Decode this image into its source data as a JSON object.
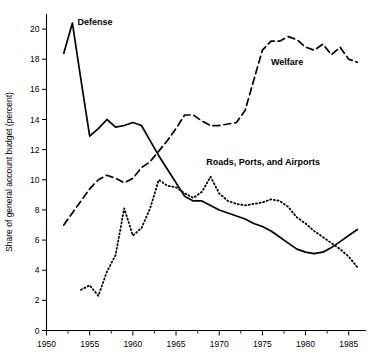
{
  "chart_data": {
    "type": "line",
    "title": "",
    "subtitle": "",
    "xlabel": "",
    "ylabel": "Share of general account budget (percent)",
    "xlim": [
      1950,
      1987
    ],
    "ylim": [
      0,
      21
    ],
    "grid": false,
    "legend_position": "inline-annotations",
    "x_ticks": [
      1950,
      1955,
      1960,
      1965,
      1970,
      1975,
      1980,
      1985
    ],
    "x_tick_labels": [
      "1950",
      "1955",
      "1960",
      "1965",
      "1970",
      "1975",
      "1980",
      "1985"
    ],
    "x_minor_ticks": [
      1952.5,
      1957.5,
      1962.5,
      1967.5,
      1972.5,
      1977.5,
      1982.5
    ],
    "y_ticks": [
      0,
      2,
      4,
      6,
      8,
      10,
      12,
      14,
      16,
      18,
      20
    ],
    "y_tick_labels": [
      "0",
      "2",
      "4",
      "6",
      "8",
      "10",
      "12",
      "14",
      "16",
      "18",
      "20"
    ],
    "series": [
      {
        "name": "Defense",
        "label": "Defense",
        "style": "solid",
        "x": [
          1952,
          1953,
          1954,
          1955,
          1956,
          1957,
          1958,
          1959,
          1960,
          1961,
          1962,
          1963,
          1964,
          1965,
          1966,
          1967,
          1968,
          1969,
          1970,
          1971,
          1972,
          1973,
          1974,
          1975,
          1976,
          1977,
          1978,
          1979,
          1980,
          1981,
          1982,
          1983,
          1984,
          1985,
          1986
        ],
        "values": [
          18.4,
          20.4,
          16.6,
          12.9,
          13.4,
          14.0,
          13.5,
          13.6,
          13.8,
          13.6,
          12.6,
          11.6,
          10.7,
          9.8,
          8.9,
          8.6,
          8.6,
          8.3,
          8.0,
          7.8,
          7.6,
          7.4,
          7.1,
          6.9,
          6.6,
          6.2,
          5.8,
          5.4,
          5.2,
          5.1,
          5.2,
          5.5,
          5.9,
          6.3,
          6.7
        ]
      },
      {
        "name": "Welfare",
        "label": "Welfare",
        "style": "dashed",
        "x": [
          1952,
          1953,
          1954,
          1955,
          1956,
          1957,
          1958,
          1959,
          1960,
          1961,
          1962,
          1963,
          1964,
          1965,
          1966,
          1967,
          1968,
          1969,
          1970,
          1971,
          1972,
          1973,
          1974,
          1975,
          1976,
          1977,
          1978,
          1979,
          1980,
          1981,
          1982,
          1983,
          1984,
          1985,
          1986
        ],
        "values": [
          7.0,
          7.8,
          8.6,
          9.4,
          10.0,
          10.3,
          10.1,
          9.8,
          10.1,
          10.8,
          11.2,
          11.9,
          12.6,
          13.4,
          14.3,
          14.3,
          13.9,
          13.6,
          13.6,
          13.7,
          13.8,
          14.6,
          16.6,
          18.6,
          19.2,
          19.2,
          19.5,
          19.3,
          18.8,
          18.6,
          19.0,
          18.3,
          18.8,
          18.0,
          17.8
        ]
      },
      {
        "name": "Roads, Ports, and Airports",
        "label": "Roads, Ports, and Airports",
        "style": "dotted",
        "x": [
          1954,
          1955,
          1956,
          1957,
          1958,
          1959,
          1960,
          1961,
          1962,
          1963,
          1964,
          1965,
          1966,
          1967,
          1968,
          1969,
          1970,
          1971,
          1972,
          1973,
          1974,
          1975,
          1976,
          1977,
          1978,
          1979,
          1980,
          1981,
          1982,
          1983,
          1984,
          1985,
          1986
        ],
        "values": [
          2.7,
          3.0,
          2.3,
          3.9,
          5.0,
          8.1,
          6.3,
          6.8,
          8.1,
          10.0,
          9.6,
          9.5,
          9.1,
          8.8,
          9.2,
          10.2,
          9.1,
          8.6,
          8.4,
          8.3,
          8.4,
          8.5,
          8.7,
          8.6,
          8.2,
          7.5,
          7.1,
          6.6,
          6.2,
          5.8,
          5.4,
          4.9,
          4.2
        ]
      }
    ],
    "annotations": [
      {
        "name": "defense-label",
        "text": "Defense",
        "x": 1953.6,
        "y": 20.3
      },
      {
        "name": "welfare-label",
        "text": "Welfare",
        "x": 1976.0,
        "y": 17.6
      },
      {
        "name": "roads-label",
        "text": "Roads, Ports, and Airports",
        "x": 1968.5,
        "y": 11.0
      }
    ]
  }
}
